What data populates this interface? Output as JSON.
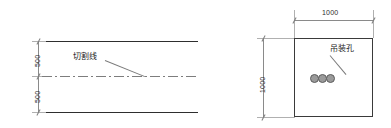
{
  "drawing": {
    "title": "",
    "colors": {
      "outline": "#3a3a3a",
      "dimension": "#8a8a8a",
      "centerline": "#7d7d7d",
      "hole_fill": "#9a9a9a",
      "hole_stroke": "#5d5d5d",
      "background": "#ffffff",
      "text": "#1a1a1a"
    },
    "left_view": {
      "name": "elevation-view",
      "dimensions": [
        {
          "label": "500",
          "orientation": "vertical",
          "position": "upper-left"
        },
        {
          "label": "500",
          "orientation": "vertical",
          "position": "lower-left"
        }
      ],
      "annotations": [
        {
          "label": "切割线",
          "meaning": "cutting-line",
          "leader": true
        }
      ]
    },
    "right_view": {
      "name": "section-view",
      "dimensions": [
        {
          "label": "1000",
          "orientation": "horizontal",
          "position": "top"
        },
        {
          "label": "1000",
          "orientation": "vertical",
          "position": "left"
        }
      ],
      "annotations": [
        {
          "label": "吊装孔",
          "meaning": "lifting-hole",
          "leader": true
        }
      ],
      "holes": {
        "count": 3
      }
    }
  }
}
